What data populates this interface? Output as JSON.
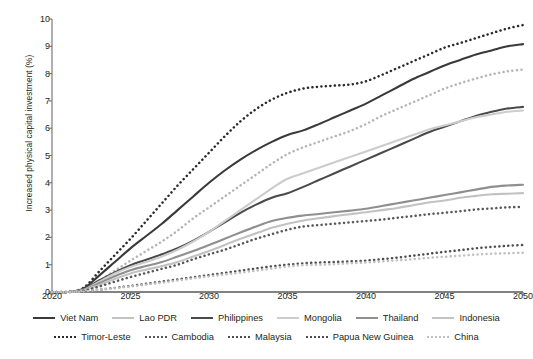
{
  "chart_data": {
    "type": "line",
    "title": "",
    "xlabel": "",
    "ylabel": "Increased physical capital investment (%)",
    "xlim": [
      2020,
      2050
    ],
    "ylim": [
      0,
      10
    ],
    "xticks": [
      "2020",
      "2025",
      "2030",
      "2035",
      "2040",
      "2045",
      "2050"
    ],
    "yticks": [
      "0",
      "1",
      "2",
      "3",
      "4",
      "5",
      "6",
      "7",
      "8",
      "9",
      "10"
    ],
    "grid": false,
    "legend_position": "bottom",
    "x": [
      2020,
      2021,
      2022,
      2023,
      2024,
      2025,
      2026,
      2027,
      2028,
      2029,
      2030,
      2031,
      2032,
      2033,
      2034,
      2035,
      2036,
      2037,
      2038,
      2039,
      2040,
      2041,
      2042,
      2043,
      2044,
      2045,
      2046,
      2047,
      2048,
      2049,
      2050
    ],
    "series": [
      {
        "name": "Timor-Leste",
        "style": "dotted",
        "color": "#2b2b2b",
        "values": [
          0.0,
          0.0,
          0.15,
          0.75,
          1.35,
          1.95,
          2.6,
          3.25,
          3.9,
          4.5,
          5.1,
          5.7,
          6.25,
          6.7,
          7.05,
          7.3,
          7.45,
          7.52,
          7.56,
          7.6,
          7.72,
          7.95,
          8.2,
          8.45,
          8.7,
          8.95,
          9.12,
          9.3,
          9.48,
          9.65,
          9.78
        ]
      },
      {
        "name": "Viet Nam",
        "style": "solid",
        "color": "#3a3a3a",
        "values": [
          0.0,
          0.0,
          0.12,
          0.6,
          1.1,
          1.6,
          2.05,
          2.5,
          3.0,
          3.5,
          4.0,
          4.45,
          4.85,
          5.2,
          5.5,
          5.75,
          5.92,
          6.15,
          6.4,
          6.65,
          6.9,
          7.2,
          7.5,
          7.8,
          8.05,
          8.3,
          8.5,
          8.7,
          8.85,
          9.0,
          9.08
        ]
      },
      {
        "name": "Malaysia",
        "style": "dotted",
        "color": "#b5b5b5",
        "values": [
          0.0,
          0.0,
          0.08,
          0.4,
          0.78,
          1.15,
          1.5,
          1.85,
          2.25,
          2.7,
          3.1,
          3.5,
          3.9,
          4.3,
          4.7,
          5.05,
          5.3,
          5.5,
          5.7,
          5.9,
          6.15,
          6.45,
          6.7,
          6.95,
          7.2,
          7.45,
          7.65,
          7.82,
          7.97,
          8.08,
          8.15
        ]
      },
      {
        "name": "Philippines",
        "style": "solid",
        "color": "#4a4a4a",
        "values": [
          0.0,
          0.0,
          0.1,
          0.42,
          0.72,
          0.98,
          1.18,
          1.38,
          1.6,
          1.88,
          2.2,
          2.55,
          2.9,
          3.2,
          3.45,
          3.62,
          3.85,
          4.1,
          4.35,
          4.6,
          4.85,
          5.1,
          5.35,
          5.6,
          5.85,
          6.05,
          6.25,
          6.45,
          6.6,
          6.72,
          6.78
        ]
      },
      {
        "name": "Mongolia",
        "style": "solid",
        "color": "#cccccc",
        "values": [
          0.0,
          0.0,
          0.08,
          0.38,
          0.68,
          0.92,
          1.1,
          1.3,
          1.55,
          1.85,
          2.2,
          2.6,
          3.0,
          3.4,
          3.8,
          4.15,
          4.35,
          4.55,
          4.75,
          4.95,
          5.15,
          5.35,
          5.55,
          5.75,
          5.95,
          6.1,
          6.25,
          6.4,
          6.5,
          6.6,
          6.65
        ]
      },
      {
        "name": "Thailand",
        "style": "solid",
        "color": "#8f8f8f",
        "values": [
          0.0,
          0.0,
          0.07,
          0.32,
          0.58,
          0.8,
          0.95,
          1.1,
          1.3,
          1.5,
          1.72,
          1.95,
          2.18,
          2.4,
          2.6,
          2.72,
          2.8,
          2.86,
          2.92,
          2.98,
          3.05,
          3.15,
          3.25,
          3.35,
          3.45,
          3.55,
          3.65,
          3.75,
          3.85,
          3.9,
          3.93
        ]
      },
      {
        "name": "Indonesia",
        "style": "solid",
        "color": "#c2c2c2",
        "values": [
          0.0,
          0.0,
          0.06,
          0.26,
          0.48,
          0.68,
          0.82,
          0.95,
          1.1,
          1.3,
          1.5,
          1.72,
          1.95,
          2.15,
          2.35,
          2.5,
          2.62,
          2.7,
          2.78,
          2.85,
          2.92,
          3.0,
          3.08,
          3.18,
          3.28,
          3.35,
          3.45,
          3.52,
          3.58,
          3.6,
          3.62
        ]
      },
      {
        "name": "Cambodia",
        "style": "dotted",
        "color": "#585858",
        "values": [
          0.0,
          0.0,
          0.05,
          0.2,
          0.38,
          0.55,
          0.7,
          0.85,
          1.0,
          1.2,
          1.38,
          1.55,
          1.75,
          1.95,
          2.12,
          2.28,
          2.4,
          2.45,
          2.5,
          2.55,
          2.6,
          2.65,
          2.72,
          2.78,
          2.85,
          2.9,
          2.96,
          3.02,
          3.06,
          3.1,
          3.12
        ]
      },
      {
        "name": "Papua New Guinea",
        "style": "dotted",
        "color": "#4f4f4f",
        "values": [
          0.0,
          0.0,
          0.02,
          0.08,
          0.15,
          0.22,
          0.3,
          0.38,
          0.46,
          0.54,
          0.62,
          0.7,
          0.78,
          0.86,
          0.94,
          1.0,
          1.05,
          1.08,
          1.1,
          1.12,
          1.15,
          1.2,
          1.26,
          1.33,
          1.4,
          1.47,
          1.53,
          1.6,
          1.65,
          1.69,
          1.72
        ]
      },
      {
        "name": "China",
        "style": "dotted",
        "color": "#c0c0c0",
        "values": [
          0.0,
          0.0,
          0.02,
          0.08,
          0.14,
          0.2,
          0.27,
          0.34,
          0.42,
          0.5,
          0.57,
          0.64,
          0.71,
          0.78,
          0.86,
          0.93,
          0.98,
          1.0,
          1.02,
          1.05,
          1.08,
          1.12,
          1.16,
          1.2,
          1.25,
          1.29,
          1.33,
          1.37,
          1.4,
          1.42,
          1.44
        ]
      }
    ]
  },
  "legend": {
    "rows": [
      [
        {
          "label": "Viet Nam",
          "style": "solid",
          "color": "#3a3a3a"
        },
        {
          "label": "Lao PDR",
          "style": "solid",
          "color": "#c2c2c2"
        },
        {
          "label": "Philippines",
          "style": "solid",
          "color": "#4a4a4a"
        },
        {
          "label": "Mongolia",
          "style": "solid",
          "color": "#cccccc"
        },
        {
          "label": "Thailand",
          "style": "solid",
          "color": "#8f8f8f"
        },
        {
          "label": "Indonesia",
          "style": "solid",
          "color": "#c2c2c2"
        }
      ],
      [
        {
          "label": "Timor-Leste",
          "style": "dotted",
          "color": "#2b2b2b"
        },
        {
          "label": "Cambodia",
          "style": "dotted",
          "color": "#585858"
        },
        {
          "label": "Malaysia",
          "style": "dotted",
          "color": "#4f4f4f"
        },
        {
          "label": "Papua New Guinea",
          "style": "dotted",
          "color": "#4f4f4f"
        },
        {
          "label": "China",
          "style": "dotted",
          "color": "#c0c0c0"
        }
      ]
    ]
  },
  "axes": {
    "y_label": "Increased physical capital investment (%)"
  }
}
